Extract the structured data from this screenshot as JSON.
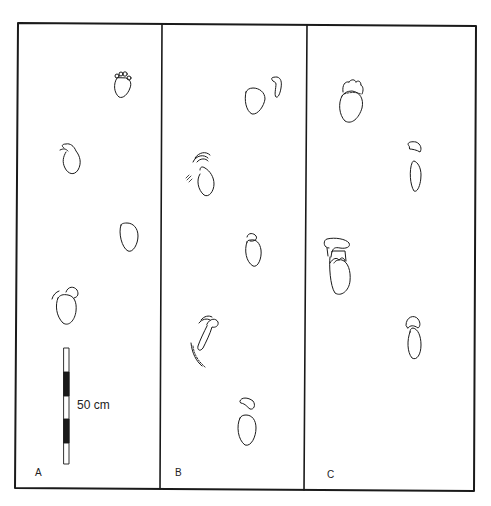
{
  "figure": {
    "type": "footprint trackway diagram",
    "panels": [
      {
        "id": "A",
        "label": "A",
        "footprint_count": 4,
        "notes": "toe impressions on upper print"
      },
      {
        "id": "B",
        "label": "B",
        "footprint_count": 5,
        "notes": "sliding/smeared prints with separated toe pads"
      },
      {
        "id": "C",
        "label": "C",
        "footprint_count": 4,
        "notes": "separated toe pads above heel impressions"
      }
    ],
    "scale_bar": {
      "label": "50 cm",
      "segments": [
        "white",
        "black",
        "white",
        "black",
        "white"
      ]
    },
    "colors": {
      "line": "#1a1a1a",
      "background": "#ffffff"
    }
  }
}
